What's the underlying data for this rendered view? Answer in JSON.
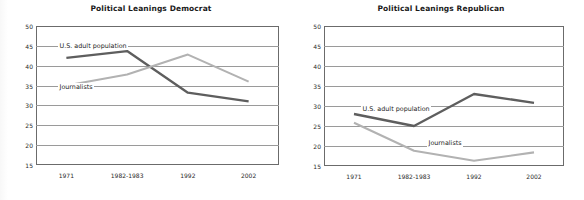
{
  "figure": {
    "background_color": "#ffffff",
    "panels": [
      {
        "id": "democrat",
        "title": "Political Leanings Democrat"
      },
      {
        "id": "republican",
        "title": "Political Leanings Republican"
      }
    ]
  },
  "series_colors": {
    "us_adult_population": "#5e5e5e",
    "journalists": "#b2b2b2"
  },
  "axis": {
    "y_ticks": [
      "50",
      "45",
      "40",
      "35",
      "30",
      "25",
      "20",
      "15"
    ],
    "x_ticks": [
      "1971",
      "1982-1983",
      "1992",
      "2002"
    ]
  },
  "labels": {
    "us_adult_population": "U.S. adult population",
    "journalists": "Journalists"
  },
  "chart_data": [
    {
      "type": "line",
      "title": "Political Leanings Democrat",
      "xlabel": "",
      "ylabel": "",
      "categories": [
        "1971",
        "1982-1983",
        "1992",
        "2002"
      ],
      "ylim": [
        15,
        50
      ],
      "yticks": [
        15,
        20,
        25,
        30,
        35,
        40,
        45,
        50
      ],
      "grid": true,
      "legend": "inline-annotations",
      "series": [
        {
          "name": "U.S. adult population",
          "color": "#5e5e5e",
          "values": [
            42.0,
            43.7,
            33.2,
            31.0
          ]
        },
        {
          "name": "Journalists",
          "color": "#b2b2b2",
          "values": [
            35.0,
            37.8,
            42.8,
            36.0
          ]
        }
      ]
    },
    {
      "type": "line",
      "title": "Political Leanings Republican",
      "xlabel": "",
      "ylabel": "",
      "categories": [
        "1971",
        "1982-1983",
        "1992",
        "2002"
      ],
      "ylim": [
        15,
        50
      ],
      "yticks": [
        15,
        20,
        25,
        30,
        35,
        40,
        45,
        50
      ],
      "grid": true,
      "legend": "inline-annotations",
      "series": [
        {
          "name": "U.S. adult population",
          "color": "#5e5e5e",
          "values": [
            28.0,
            25.0,
            33.0,
            30.8
          ]
        },
        {
          "name": "Journalists",
          "color": "#b2b2b2",
          "values": [
            25.8,
            18.8,
            16.3,
            18.4
          ]
        }
      ]
    }
  ]
}
